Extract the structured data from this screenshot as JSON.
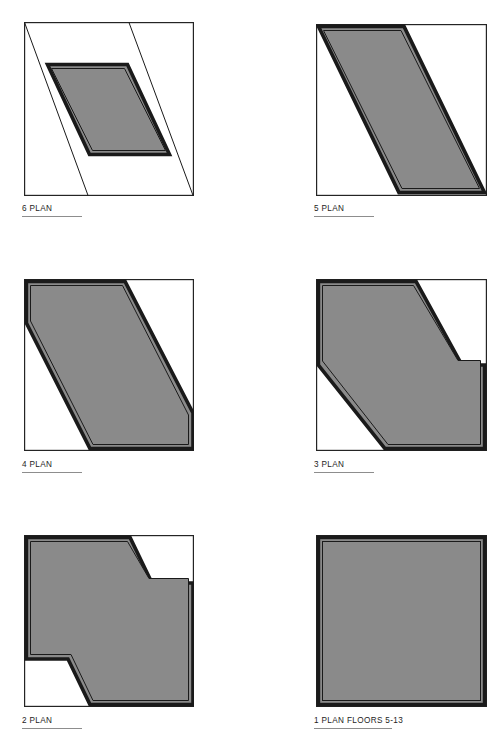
{
  "sheet": {
    "title": "Architectural Floor Plan Diagram Sheet",
    "width": 500,
    "height": 741,
    "background_color": "#ffffff",
    "fill_color": "#8a8a8a",
    "outline_color": "#1a1a1a",
    "frame_color": "#242424",
    "label_color": "#1c1c1c",
    "rule_color": "#8d8d8d"
  },
  "panels": [
    {
      "id": "plan-6",
      "label": "6 PLAN",
      "label_icon": "floor-plan-icon",
      "shape": "sheared parallelogram centered within square frame",
      "frame": {
        "x": 24,
        "y": 22,
        "width": 170,
        "height": 174
      },
      "label_position": {
        "x": 22,
        "y": 204
      },
      "rule": {
        "x": 22,
        "y": 216,
        "width": 60
      }
    },
    {
      "id": "plan-5",
      "label": "5 PLAN",
      "label_icon": "floor-plan-icon",
      "shape": "full-height sheared parallelogram spanning square frame",
      "frame": {
        "x": 316,
        "y": 24,
        "width": 171,
        "height": 172
      },
      "label_position": {
        "x": 314,
        "y": 204
      },
      "rule": {
        "x": 314,
        "y": 216,
        "width": 60
      }
    },
    {
      "id": "plan-4",
      "label": "4 PLAN",
      "label_icon": "floor-plan-icon",
      "shape": "Z-shaped band descending left to right with stepped notches",
      "frame": {
        "x": 24,
        "y": 279,
        "width": 170,
        "height": 172
      },
      "label_position": {
        "x": 22,
        "y": 460
      },
      "rule": {
        "x": 22,
        "y": 472,
        "width": 60
      }
    },
    {
      "id": "plan-3",
      "label": "3 PLAN",
      "label_icon": "floor-plan-icon",
      "shape": "Z-shaped mass with upper-left and lower-right blocks joined diagonally",
      "frame": {
        "x": 316,
        "y": 279,
        "width": 171,
        "height": 172
      },
      "label_position": {
        "x": 314,
        "y": 460
      },
      "rule": {
        "x": 314,
        "y": 472,
        "width": 60
      }
    },
    {
      "id": "plan-2",
      "label": "2 PLAN",
      "label_icon": "floor-plan-icon",
      "shape": "near-full square with chamfered upper-right and lower-left corners",
      "frame": {
        "x": 24,
        "y": 535,
        "width": 170,
        "height": 172
      },
      "label_position": {
        "x": 22,
        "y": 716
      },
      "rule": {
        "x": 22,
        "y": 728,
        "width": 60
      }
    },
    {
      "id": "plan-1",
      "label": "1 PLAN FLOORS 5-13",
      "label_icon": "floor-plan-icon",
      "shape": "full solid square floor plate",
      "frame": {
        "x": 316,
        "y": 535,
        "width": 171,
        "height": 172
      },
      "label_position": {
        "x": 314,
        "y": 716
      },
      "rule": {
        "x": 314,
        "y": 728,
        "width": 78
      }
    }
  ]
}
